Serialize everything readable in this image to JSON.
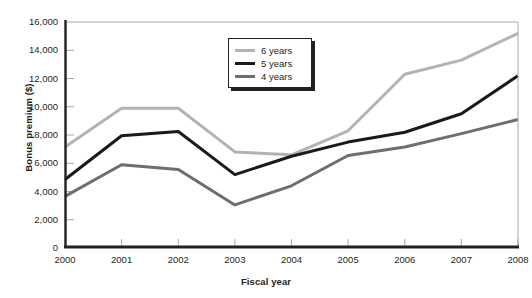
{
  "chart_data": {
    "type": "line",
    "title": "",
    "xlabel": "Fiscal year",
    "ylabel": "Bonus premium ($)",
    "categories": [
      "2000",
      "2001",
      "2002",
      "2003",
      "2004",
      "2005",
      "2006",
      "2007",
      "2008"
    ],
    "x": [
      2000,
      2001,
      2002,
      2003,
      2004,
      2005,
      2006,
      2007,
      2008
    ],
    "xlim": [
      2000,
      2008
    ],
    "ylim": [
      0,
      16000
    ],
    "ytick_labels": [
      "0",
      "2,000",
      "4,000",
      "6,000",
      "8,000",
      "10,000",
      "12,000",
      "14,000",
      "16,000"
    ],
    "ytick_values": [
      0,
      2000,
      4000,
      6000,
      8000,
      10000,
      12000,
      14000,
      16000
    ],
    "grid": false,
    "legend_position": "top-center",
    "series": [
      {
        "name": "6 years",
        "color": "#b3b3b3",
        "width": 3,
        "values": [
          7150,
          9900,
          9900,
          6800,
          6600,
          8300,
          12300,
          13300,
          15200
        ]
      },
      {
        "name": "5 years",
        "color": "#1a1a1a",
        "width": 3,
        "values": [
          4850,
          7950,
          8250,
          5200,
          6500,
          7500,
          8200,
          9500,
          12200
        ]
      },
      {
        "name": "4 years",
        "color": "#6d6e71",
        "width": 3,
        "values": [
          3650,
          5900,
          5550,
          3050,
          4400,
          6550,
          7150,
          8100,
          9100
        ]
      }
    ]
  },
  "axes": {
    "y_title": "Bonus premium ($)",
    "x_title": "Fiscal year",
    "frame_color": "#231f20"
  }
}
